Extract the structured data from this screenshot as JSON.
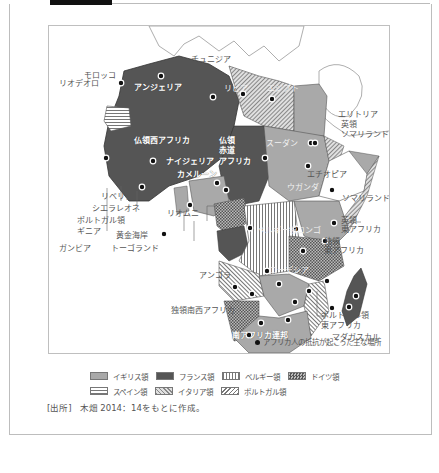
{
  "figure": {
    "title_tab_visible": true
  },
  "colors": {
    "british": "#a9a9a9",
    "french": "#555555",
    "background": "#ffffff",
    "resistance_dot": "#111111"
  },
  "map": {
    "labels": {
      "tunisia": "チュニジア",
      "morocco": "モロッコ",
      "spanish_sahara": "スペイン",
      "rio_de_oro": "リオデオロ",
      "algeria": "アンジェリア",
      "libya": "リビア",
      "egypt": "エジプト",
      "eritrea": "エリトリア",
      "british_somaliland_1": "英領",
      "british_somaliland_2": "ソマリランド",
      "french_west_africa": "仏領西アフリカ",
      "french_equatorial_1": "仏領",
      "french_equatorial_2": "赤道",
      "french_equatorial_3": "アフリカ",
      "sudan": "スーダン",
      "ethiopia": "エチオピア",
      "nigeria": "ナイジェリア",
      "cameroon": "カメルーン",
      "somaliland": "ソマリランド",
      "uganda": "ウガンダ",
      "british_east_africa_1": "英領",
      "british_east_africa_2": "東アフリカ",
      "german_east_africa_1": "独領",
      "german_east_africa_2": "東アフリカ",
      "belgian_congo": "ベルギー領コンゴ",
      "rio_muni": "リオムニ",
      "angola": "アンゴラ",
      "rhodesia": "ローデシア",
      "german_sw_africa": "独領南西アフリカ",
      "south_africa": "南アフリカ連邦",
      "madagascar": "マダガスカル",
      "portuguese_ea_1": "ポルトガル領",
      "portuguese_ea_2": "東アフリカ",
      "liberia": "リベリア",
      "sierra_leone": "シエラレオネ",
      "portuguese_guinea_1": "ポルトガル領",
      "portuguese_guinea_2": "ギニア",
      "gold_coast": "黄金海岸",
      "gambia": "ガンビア",
      "togoland": "トーゴランド"
    },
    "resistance_note": "アフリカ人の抵抗が起こった主な場所"
  },
  "legend": {
    "row1": [
      {
        "key": "british",
        "label": "イギリス領"
      },
      {
        "key": "french",
        "label": "フランス領"
      },
      {
        "key": "belgian",
        "label": "ベルギー領"
      },
      {
        "key": "german",
        "label": "ドイツ領"
      }
    ],
    "row2": [
      {
        "key": "spanish",
        "label": "スペイン領"
      },
      {
        "key": "italian",
        "label": "イタリア領"
      },
      {
        "key": "portuguese",
        "label": "ポルトガル領"
      }
    ]
  },
  "source": {
    "tag": "[出所]",
    "text": "木畑 2014：14をもとに作成。"
  }
}
